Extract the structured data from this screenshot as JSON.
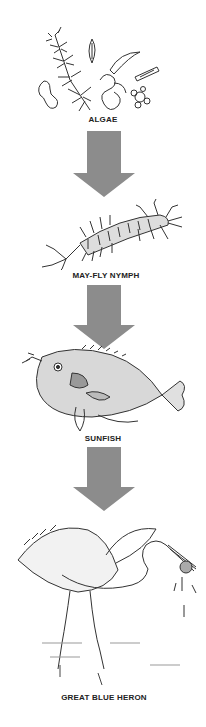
{
  "diagram": {
    "type": "food-chain",
    "direction": "top-to-bottom",
    "arrow_color": "#8c8c8c",
    "organisms": [
      {
        "label": "ALGAE",
        "icon": "algae-illustration"
      },
      {
        "label": "MAY-FLY  NYMPH",
        "icon": "mayfly-nymph-illustration"
      },
      {
        "label": "SUNFISH",
        "icon": "sunfish-illustration"
      },
      {
        "label": "GREAT BLUE  HERON",
        "icon": "heron-illustration"
      }
    ],
    "arrows": [
      {
        "from": "ALGAE",
        "to": "MAY-FLY  NYMPH"
      },
      {
        "from": "MAY-FLY  NYMPH",
        "to": "SUNFISH"
      },
      {
        "from": "SUNFISH",
        "to": "GREAT BLUE  HERON"
      }
    ]
  }
}
